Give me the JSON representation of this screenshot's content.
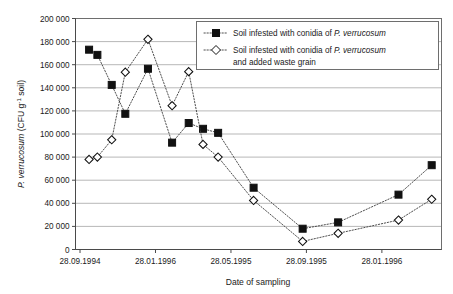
{
  "chart_data": {
    "type": "line",
    "title": "",
    "xlabel": "Date of sampling",
    "ylabel": "P. verrucosum (CFU g-1 soil)",
    "ylabel_parts": {
      "italic": "P. verrucosum",
      "rest": " (CFU g",
      "superscript": "-1",
      "tail": " soil)"
    },
    "ylim": [
      0,
      200000
    ],
    "ytick_labels": [
      "0",
      "20 000",
      "40 000",
      "60 000",
      "80 000",
      "100 000",
      "120 000",
      "140 000",
      "160 000",
      "180 000",
      "200 000"
    ],
    "ytick_values": [
      0,
      20000,
      40000,
      60000,
      80000,
      100000,
      120000,
      140000,
      160000,
      180000,
      200000
    ],
    "xtick_labels": [
      "28.09.1994",
      "28.01.1996",
      "28.05.1995",
      "28.09.1995",
      "28.01.1996"
    ],
    "xtick_positions": [
      0,
      1,
      2,
      3,
      4
    ],
    "xlim": [
      -0.06,
      4.79
    ],
    "grid": "horizontal",
    "legend_position": "top-right",
    "series": [
      {
        "name": "Soil infested with conidia of P. verrucosum",
        "marker": "filled-square",
        "name_italic_part": "P. verrucosum",
        "name_plain_part": "Soil infested with conidia of ",
        "x": [
          0.12,
          0.23,
          0.42,
          0.6,
          0.9,
          1.22,
          1.44,
          1.63,
          1.83,
          2.3,
          2.95,
          3.42,
          4.22,
          4.66
        ],
        "y": [
          173000,
          168500,
          142500,
          117500,
          156500,
          92500,
          109500,
          104500,
          101000,
          53500,
          18000,
          23500,
          47500,
          73000
        ]
      },
      {
        "name": "Soil infested with conidia of P. verrucosum and added waste grain",
        "marker": "open-diamond",
        "name_italic_part": "P. verrucosum",
        "name_plain_part": "Soil infested with conidia of ",
        "name_line2": "and added waste grain",
        "x": [
          0.12,
          0.23,
          0.42,
          0.6,
          0.9,
          1.22,
          1.44,
          1.63,
          1.83,
          2.3,
          2.95,
          3.42,
          4.22,
          4.66
        ],
        "y": [
          78000,
          80000,
          95000,
          153500,
          182000,
          124500,
          154000,
          91000,
          80000,
          42500,
          7000,
          14000,
          25500,
          43500
        ]
      }
    ]
  },
  "legend": {
    "entries": [
      {
        "plain": "Soil infested with conidia of ",
        "italic": "P. verrucosum",
        "line2": ""
      },
      {
        "plain": "Soil infested with conidia of ",
        "italic": "P. verrucosum",
        "line2": "and added waste grain"
      }
    ]
  },
  "axes": {
    "x_title": "Date of sampling"
  }
}
